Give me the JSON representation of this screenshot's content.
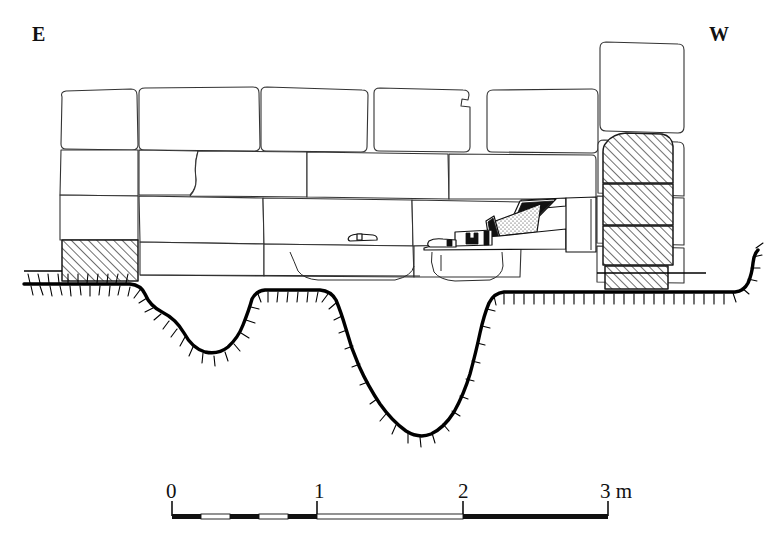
{
  "figure": {
    "kind": "archaeological-section-drawing",
    "ink_color": "#1a1a1a",
    "background_color": "#ffffff",
    "hatch_color": "#1a1a1a"
  },
  "orientation": {
    "left_label": "E",
    "right_label": "W"
  },
  "scale_bar": {
    "unit_label": "m",
    "ticks": [
      {
        "value": "0",
        "x": 172
      },
      {
        "value": "1",
        "x": 320
      },
      {
        "value": "2",
        "x": 465
      },
      {
        "value": "3 m",
        "x": 608
      }
    ],
    "bar_left_x": 172,
    "bar_right_x": 608,
    "bar_y": 516,
    "subdivisions_per_meter": 5,
    "subdivided_segment": "0-1",
    "total_length_meters": 3
  },
  "courses": [
    {
      "name": "course-1-top",
      "blocks": [
        {
          "id": "b1-1",
          "fill": "plain"
        },
        {
          "id": "b1-2",
          "fill": "plain"
        },
        {
          "id": "b1-3",
          "fill": "plain"
        },
        {
          "id": "b1-4",
          "fill": "plain"
        },
        {
          "id": "b1-5",
          "fill": "plain"
        },
        {
          "id": "b1-6",
          "fill": "plain"
        }
      ]
    },
    {
      "name": "course-2",
      "blocks": [
        {
          "id": "b2-1",
          "fill": "plain"
        },
        {
          "id": "b2-2",
          "fill": "plain"
        },
        {
          "id": "b2-3",
          "fill": "plain"
        },
        {
          "id": "b2-4",
          "fill": "plain"
        },
        {
          "id": "b2-5",
          "fill": "plain"
        }
      ]
    },
    {
      "name": "course-3",
      "blocks": [
        {
          "id": "b3-1",
          "fill": "plain"
        },
        {
          "id": "b3-2",
          "fill": "plain"
        },
        {
          "id": "b3-3",
          "fill": "plain"
        },
        {
          "id": "b3-4",
          "fill": "hatched"
        }
      ]
    },
    {
      "name": "course-4-bottom",
      "blocks": [
        {
          "id": "b4-1",
          "fill": "hatched"
        },
        {
          "id": "b4-2",
          "fill": "plain"
        },
        {
          "id": "b4-3",
          "fill": "plain"
        },
        {
          "id": "b4-4",
          "fill": "plain"
        },
        {
          "id": "b4-5",
          "fill": "hatched"
        }
      ]
    }
  ],
  "hatched_blocks": {
    "left_count": 1,
    "right_column_count": 4,
    "note": "diagonal line hatch, lower-left to upper-right"
  },
  "fill_deposit": {
    "label": "rubble and debris fill behind wall face",
    "has_stipple_texture": true
  },
  "foundation_trench": {
    "label": "bedrock cut",
    "convention": "heavy line with inward tapered tick marks",
    "lobes": 2
  }
}
